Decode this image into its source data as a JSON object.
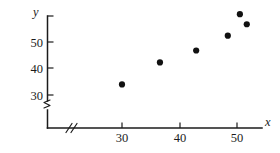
{
  "chart_data": {
    "type": "scatter",
    "title": "",
    "xlabel": "x",
    "ylabel": "y",
    "x": [
      30,
      36.6,
      42.9,
      48.4,
      50.5,
      51.7
    ],
    "y": [
      34,
      42.3,
      46.8,
      52.4,
      60.5,
      56.7
    ],
    "points": [
      {
        "x": 30,
        "y": 34
      },
      {
        "x": 36.6,
        "y": 42.3
      },
      {
        "x": 42.9,
        "y": 46.8
      },
      {
        "x": 48.4,
        "y": 52.4
      },
      {
        "x": 50.5,
        "y": 60.5
      },
      {
        "x": 51.7,
        "y": 56.7
      }
    ],
    "xticks": [
      30,
      40,
      50
    ],
    "xtick_labels": [
      "30",
      "40",
      "50"
    ],
    "yticks": [
      30,
      40,
      50
    ],
    "ytick_labels": [
      "30",
      "40",
      "50"
    ],
    "xlim": [
      24,
      55
    ],
    "ylim": [
      27,
      64
    ],
    "grid": false,
    "legend": null,
    "axis_break_x": true,
    "axis_break_y": true,
    "marker": "filled-circle",
    "marker_color": "#111111",
    "axis_color": "#1b1b1b"
  },
  "axes": {
    "y_title": "y",
    "x_title": "x",
    "y_tick_labels": [
      "50",
      "40",
      "30"
    ],
    "x_tick_labels": [
      "30",
      "40",
      "50"
    ]
  }
}
